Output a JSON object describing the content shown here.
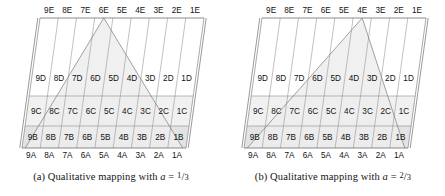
{
  "figure": {
    "panel_count": 2,
    "row_labels": [
      "A",
      "B",
      "C",
      "D",
      "E"
    ],
    "column_labels": [
      "9",
      "8",
      "7",
      "6",
      "5",
      "4",
      "3",
      "2",
      "1"
    ],
    "colors": {
      "band_b": "#e3e3e3",
      "band_c": "#f1f1f1",
      "triangle_fill": "#ededed",
      "grid": "#8d8d8d",
      "frame": "#6f6f6f",
      "text": "#111111",
      "background": "#ffffff"
    }
  },
  "panels": [
    {
      "id": "panel-a",
      "caption_prefix": "(a) Qualitative mapping with ",
      "caption_var": "a",
      "caption_eq": " = ",
      "caption_num": "1",
      "caption_den": "3",
      "a_value": "1/3",
      "triangle_apex_label": "6E",
      "triangle_apex_column": "6",
      "skew_direction": "right-leaning",
      "rows": {
        "E": [
          "9E",
          "8E",
          "7E",
          "6E",
          "5E",
          "4E",
          "3E",
          "2E",
          "1E"
        ],
        "D": [
          "9D",
          "8D",
          "7D",
          "6D",
          "5D",
          "4D",
          "3D",
          "2D",
          "1D"
        ],
        "C": [
          "9C",
          "8C",
          "7C",
          "6C",
          "5C",
          "4C",
          "3C",
          "2C",
          "1C"
        ],
        "B": [
          "9B",
          "8B",
          "7B",
          "6B",
          "5B",
          "4B",
          "3B",
          "2B",
          "1B"
        ],
        "A": [
          "9A",
          "8A",
          "7A",
          "6A",
          "5A",
          "4A",
          "3A",
          "2A",
          "1A"
        ]
      }
    },
    {
      "id": "panel-b",
      "caption_prefix": "(b) Qualitative mapping with ",
      "caption_var": "a",
      "caption_eq": " = ",
      "caption_num": "2",
      "caption_den": "3",
      "a_value": "2/3",
      "triangle_apex_label": "4E",
      "triangle_apex_column": "4",
      "skew_direction": "right-leaning",
      "rows": {
        "E": [
          "9E",
          "8E",
          "7E",
          "6E",
          "5E",
          "4E",
          "3E",
          "2E",
          "1E"
        ],
        "D": [
          "9D",
          "8D",
          "7D",
          "6D",
          "5D",
          "4D",
          "3D",
          "2D",
          "1D"
        ],
        "C": [
          "9C",
          "8C",
          "7C",
          "6C",
          "5C",
          "4C",
          "3C",
          "2C",
          "1C"
        ],
        "B": [
          "9B",
          "8B",
          "7B",
          "6B",
          "5B",
          "4B",
          "3B",
          "2B",
          "1B"
        ],
        "A": [
          "9A",
          "8A",
          "7A",
          "6A",
          "5A",
          "4A",
          "3A",
          "2A",
          "1A"
        ]
      }
    }
  ]
}
